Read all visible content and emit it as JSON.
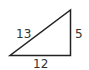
{
  "diagram": {
    "type": "right-triangle",
    "stroke_color": "#222222",
    "sides": {
      "hypotenuse": "13",
      "vertical_leg": "5",
      "horizontal_leg": "12"
    }
  }
}
